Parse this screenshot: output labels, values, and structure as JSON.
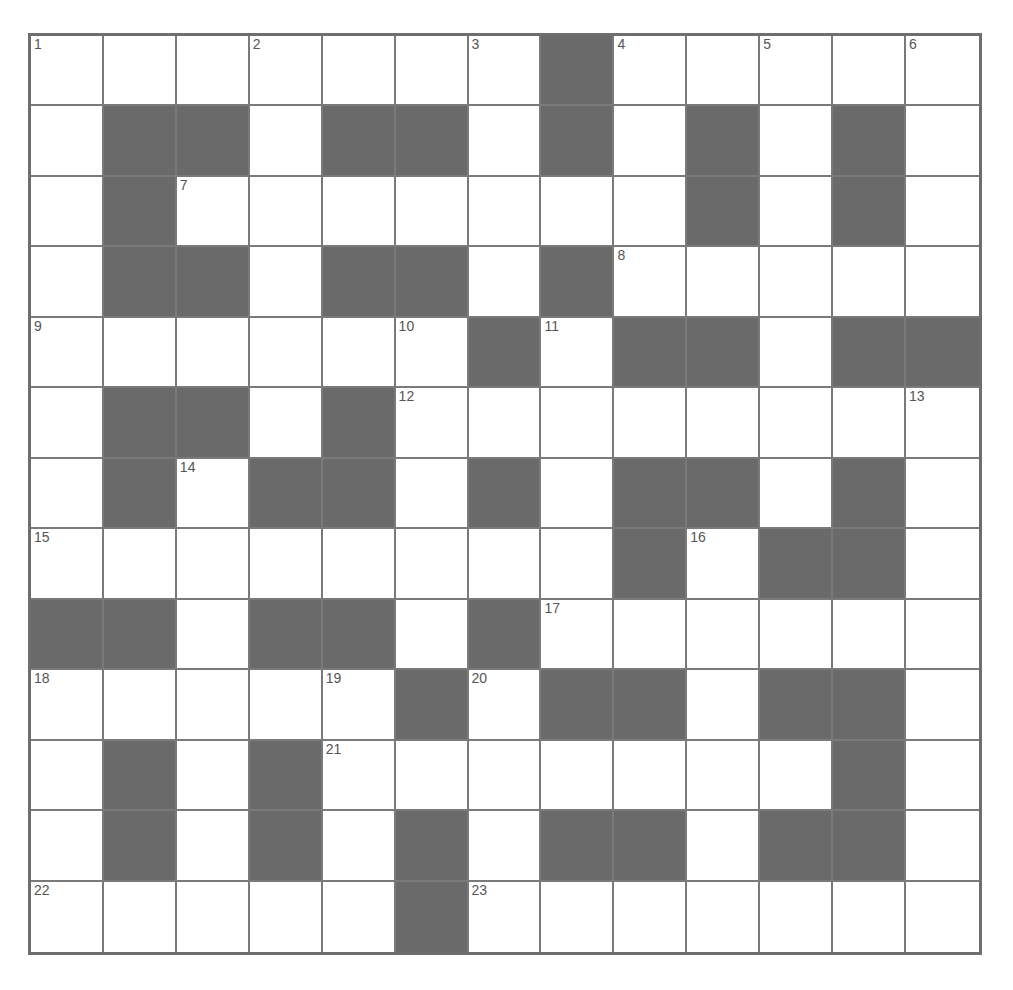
{
  "puzzle": {
    "rows": 13,
    "cols": 13,
    "colors": {
      "block": "#6a6a6a",
      "cell": "#ffffff",
      "grid_line": "#7a7a7a",
      "number": "#555555"
    },
    "layout": [
      "WWWWWWWBWWWWW",
      "WBBWBBWBWBWBW",
      "WBWWWWWWWBWBW",
      "WBBWBBWBWWWWW",
      "WWWWWWBWBBWBB",
      "WBBWBWWWWWWWW",
      "WBWBBWBWBBWBW",
      "WWWWWWWWBWBBW",
      "BBWBBWBWWWWWW",
      "WWWWWBWBBWBBW",
      "WBWBWWWWWWWBW",
      "WBWBWBWBBWBBW",
      "WWWWWBWWWWWWW"
    ],
    "numbers": [
      {
        "n": "1",
        "r": 0,
        "c": 0
      },
      {
        "n": "2",
        "r": 0,
        "c": 3
      },
      {
        "n": "3",
        "r": 0,
        "c": 6
      },
      {
        "n": "4",
        "r": 0,
        "c": 8
      },
      {
        "n": "5",
        "r": 0,
        "c": 10
      },
      {
        "n": "6",
        "r": 0,
        "c": 12
      },
      {
        "n": "7",
        "r": 2,
        "c": 2
      },
      {
        "n": "8",
        "r": 3,
        "c": 8
      },
      {
        "n": "9",
        "r": 4,
        "c": 0
      },
      {
        "n": "10",
        "r": 4,
        "c": 5
      },
      {
        "n": "11",
        "r": 4,
        "c": 7
      },
      {
        "n": "12",
        "r": 5,
        "c": 5
      },
      {
        "n": "13",
        "r": 5,
        "c": 12
      },
      {
        "n": "14",
        "r": 6,
        "c": 2
      },
      {
        "n": "15",
        "r": 7,
        "c": 0
      },
      {
        "n": "16",
        "r": 7,
        "c": 9
      },
      {
        "n": "17",
        "r": 8,
        "c": 7
      },
      {
        "n": "18",
        "r": 9,
        "c": 0
      },
      {
        "n": "19",
        "r": 9,
        "c": 4
      },
      {
        "n": "20",
        "r": 9,
        "c": 6
      },
      {
        "n": "21",
        "r": 10,
        "c": 4
      },
      {
        "n": "22",
        "r": 12,
        "c": 0
      },
      {
        "n": "23",
        "r": 12,
        "c": 6
      }
    ]
  }
}
